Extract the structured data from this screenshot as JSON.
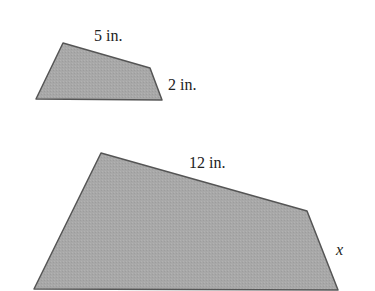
{
  "figure": {
    "small": {
      "points": "36,99 63,43 150,68 162,100",
      "top_label": "5 in.",
      "side_label": "2 in."
    },
    "large": {
      "points": "34,289 101,153 307,211 338,290",
      "top_label": "12 in.",
      "side_label": "x"
    },
    "fill": "#a9a9a9",
    "stroke": "#555555"
  }
}
